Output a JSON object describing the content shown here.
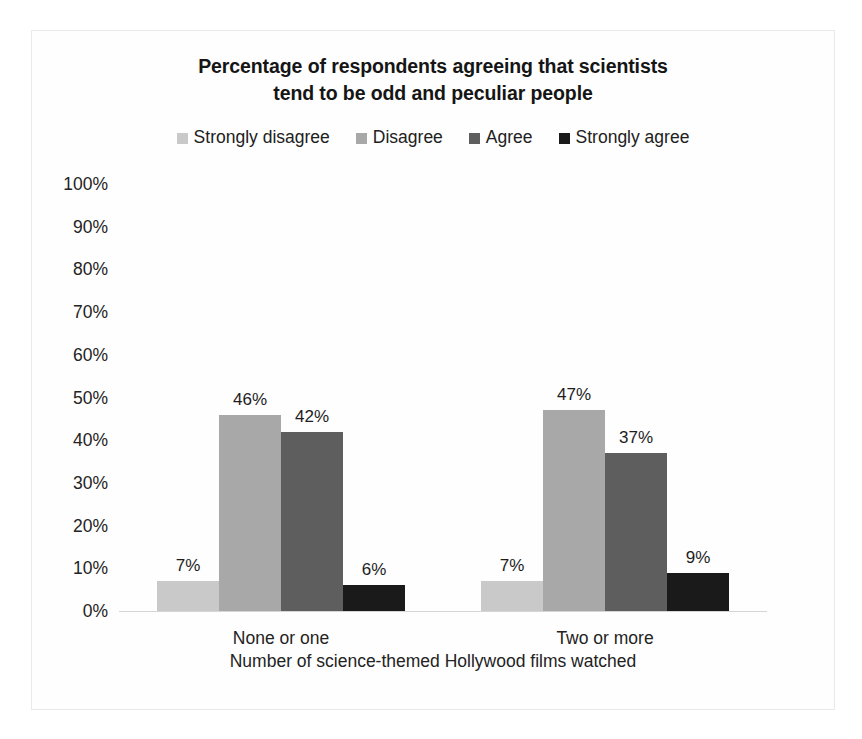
{
  "chart_data": {
    "type": "bar",
    "title": "Percentage of respondents agreeing that scientists tend to be odd and peculiar people",
    "title_lines": [
      "Percentage of respondents agreeing that scientists",
      "tend to be odd and peculiar people"
    ],
    "xlabel": "Number of science-themed Hollywood films watched",
    "ylabel": "",
    "categories": [
      "None or one",
      "Two or more"
    ],
    "series": [
      {
        "name": "Strongly disagree",
        "color": "#c9c9c9",
        "values": [
          7,
          7
        ],
        "labels": [
          "7%",
          "7%"
        ]
      },
      {
        "name": "Disagree",
        "color": "#a8a8a8",
        "values": [
          46,
          47
        ],
        "labels": [
          "46%",
          "47%"
        ]
      },
      {
        "name": "Agree",
        "color": "#5e5e5e",
        "values": [
          42,
          37
        ],
        "labels": [
          "42%",
          "37%"
        ]
      },
      {
        "name": "Strongly agree",
        "color": "#1a1a1a",
        "values": [
          6,
          9
        ],
        "labels": [
          "6%",
          "9%"
        ]
      }
    ],
    "ylim": [
      0,
      100
    ],
    "ytick_values": [
      100,
      90,
      80,
      70,
      60,
      50,
      40,
      30,
      20,
      10,
      0
    ],
    "ytick_labels": [
      "100%",
      "90%",
      "80%",
      "70%",
      "60%",
      "50%",
      "40%",
      "30%",
      "20%",
      "10%",
      "0%"
    ],
    "grid": false,
    "legend_position": "top",
    "value_labels": true,
    "value_label_format": "percent",
    "background_color": "#fefefe",
    "axis_color": "#d5d5d5",
    "text_color": "#232323"
  }
}
